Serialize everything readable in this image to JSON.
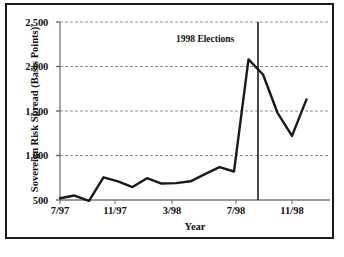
{
  "figure": {
    "background_color": "#ffffff",
    "frame_color": "#1a1a1a",
    "line_color": "#1a1a1a",
    "grid_color": "#8c8c8c",
    "axis_color": "#7a7a7a"
  },
  "chart_data": {
    "type": "line",
    "title": "",
    "xlabel": "Year",
    "ylabel": "Sovereign Risk Spread (Basis Points)",
    "ylim": [
      500,
      2500
    ],
    "yticks": [
      500,
      1000,
      1500,
      2000,
      2500
    ],
    "ytick_labels": [
      "500",
      "1,000",
      "1,500",
      "2,000",
      "2,500"
    ],
    "xticks": [
      "7/97",
      "11/97",
      "3/98",
      "7/98",
      "11/98"
    ],
    "xtick_labels": [
      "7/97",
      "11/97",
      "3/98",
      "7/98",
      "11/98"
    ],
    "grid": true,
    "grid_axis": "y",
    "legend": false,
    "x": [
      "7/97",
      "8/97",
      "9/97",
      "10/97",
      "11/97",
      "12/97",
      "1/98",
      "2/98",
      "3/98",
      "4/98",
      "5/98",
      "6/98",
      "7/98",
      "8/98",
      "9/98",
      "10/98",
      "11/98",
      "12/98"
    ],
    "values": [
      520,
      550,
      490,
      755,
      710,
      645,
      745,
      685,
      690,
      710,
      790,
      870,
      820,
      2080,
      1910,
      1480,
      1220,
      1630
    ],
    "series": [
      {
        "name": "Sovereign Risk Spread",
        "values": [
          520,
          550,
          490,
          755,
          710,
          645,
          745,
          685,
          690,
          710,
          790,
          870,
          820,
          2080,
          1910,
          1480,
          1220,
          1630
        ]
      }
    ],
    "annotations": [
      {
        "label": "1998 Elections",
        "type": "vertical-line",
        "x": "8/98",
        "y_top": 2500,
        "y_bottom": 500
      }
    ]
  }
}
